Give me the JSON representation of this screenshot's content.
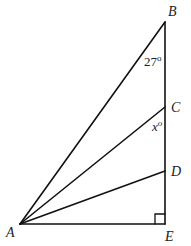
{
  "diagram": {
    "points": {
      "A": {
        "label": "A",
        "x": 20,
        "y": 224
      },
      "B": {
        "label": "B",
        "x": 165,
        "y": 22
      },
      "C": {
        "label": "C",
        "x": 165,
        "y": 107
      },
      "D": {
        "label": "D",
        "x": 165,
        "y": 171
      },
      "E": {
        "label": "E",
        "x": 165,
        "y": 224
      }
    },
    "segments": [
      "AB",
      "AC",
      "AD",
      "AE",
      "BE"
    ],
    "angles": {
      "at_B": {
        "value": "27",
        "unit": "o",
        "text": "27°"
      },
      "at_C": {
        "value": "x",
        "unit": "o"
      }
    },
    "right_angle": {
      "vertex": "E"
    },
    "stroke_color": "#111111"
  }
}
